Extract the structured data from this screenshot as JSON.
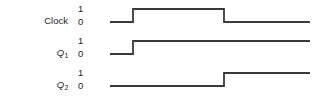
{
  "diagram": {
    "type": "digital-timing-diagram",
    "width": 316,
    "height": 98,
    "background_color": "#ffffff",
    "trace_color": "#3a3a3a",
    "text_color": "#231f20",
    "trace_width": 1.8,
    "x_start": 110,
    "x_end": 310,
    "level_marker_high": "1",
    "level_marker_low": "0",
    "signals": [
      {
        "name": "clock",
        "label": "Clock",
        "label_italic": false,
        "subscript": "",
        "y_high": 9,
        "y_low": 22,
        "label_y": 16,
        "marker_high_y": 4,
        "marker_low_y": 17,
        "initial_level": 0,
        "transitions": [
          {
            "x": 133,
            "to": 1,
            "edge": "rising"
          },
          {
            "x": 224,
            "to": 0,
            "edge": "falling"
          }
        ],
        "final_level": 0
      },
      {
        "name": "q1",
        "label": "Q",
        "label_italic": true,
        "subscript": "1",
        "y_high": 41,
        "y_low": 54,
        "label_y": 48,
        "marker_high_y": 36,
        "marker_low_y": 49,
        "initial_level": 0,
        "transitions": [
          {
            "x": 133,
            "to": 1,
            "edge": "rising"
          }
        ],
        "final_level": 1
      },
      {
        "name": "q2",
        "label": "Q",
        "label_italic": true,
        "subscript": "2",
        "y_high": 73,
        "y_low": 86,
        "label_y": 80,
        "marker_high_y": 68,
        "marker_low_y": 81,
        "initial_level": 0,
        "transitions": [
          {
            "x": 224,
            "to": 1,
            "edge": "rising"
          }
        ],
        "final_level": 1
      }
    ]
  }
}
